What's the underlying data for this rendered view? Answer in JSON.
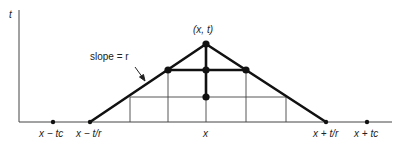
{
  "diagram": {
    "axis_labels": {
      "y": "t"
    },
    "apex_label": "(x, t)",
    "slope_label": "slope = r",
    "x_ticks": [
      {
        "label": "x − tc",
        "x": 53
      },
      {
        "label": "x − t/r",
        "x": 90
      },
      {
        "label": "x",
        "x": 206
      },
      {
        "label": "x + t/r",
        "x": 326
      },
      {
        "label": "x + tc",
        "x": 367
      }
    ],
    "colors": {
      "line": "#111111",
      "grid": "#444444",
      "background": "#ffffff"
    }
  }
}
